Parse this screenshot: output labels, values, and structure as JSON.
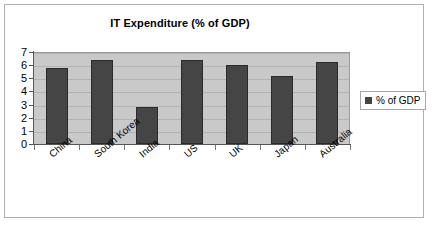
{
  "chart_data": {
    "type": "bar",
    "title": "IT Expenditure (% of GDP)",
    "xlabel": "",
    "ylabel": "",
    "categories": [
      "China",
      "South Korea",
      "India",
      "US",
      "UK",
      "Japan",
      "Australia"
    ],
    "series": [
      {
        "name": "% of GDP",
        "values": [
          5.75,
          6.4,
          2.8,
          6.4,
          6.0,
          5.2,
          6.25
        ]
      }
    ],
    "ylim": [
      0,
      7
    ],
    "ytick_labels": [
      "7",
      "6",
      "5",
      "4",
      "3",
      "2",
      "1",
      "0"
    ],
    "ytick_values": [
      7,
      6,
      5,
      4,
      3,
      2,
      1,
      0
    ],
    "grid": true,
    "legend_position": "right",
    "legend_entries": [
      "% of GDP"
    ],
    "colors": {
      "bar": "#454545",
      "bar_border": "#2a2a2a",
      "plot_background": "#c9c9c9",
      "gridline": "#b3b3b3",
      "axis": "#555555",
      "frame_border": "#b0b0b0",
      "page_background": "#ffffff",
      "text": "#000000"
    }
  },
  "legend": {
    "label": "% of GDP",
    "swatch_name": "legend-color-swatch"
  }
}
